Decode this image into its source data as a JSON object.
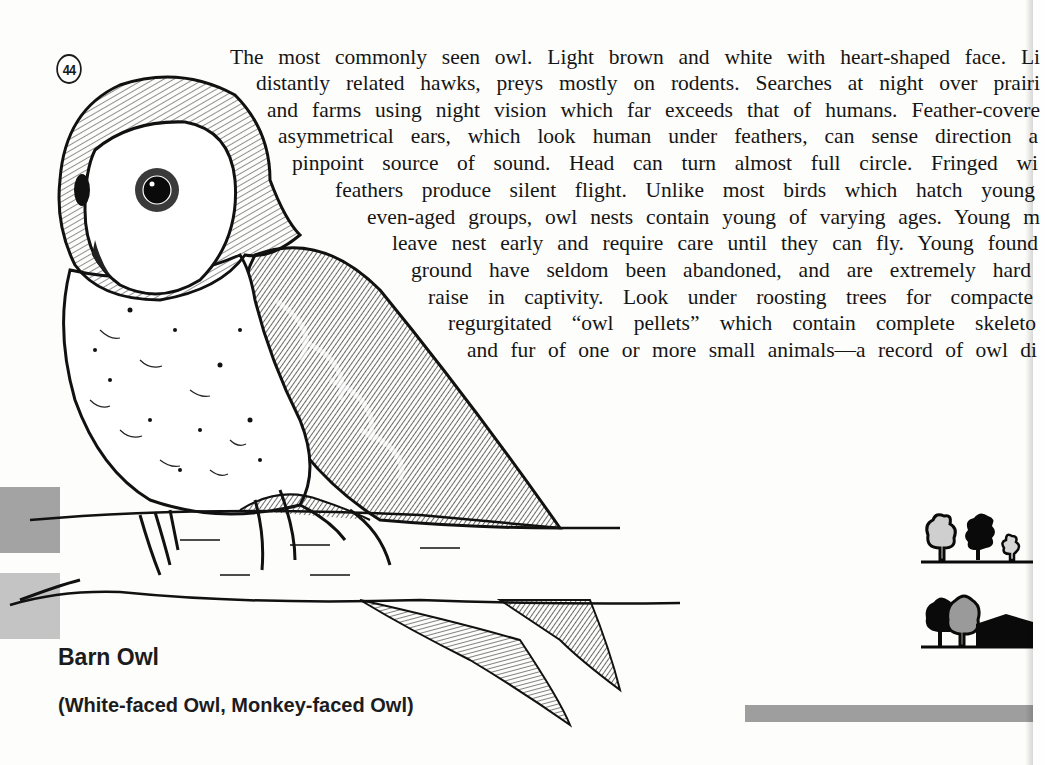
{
  "plate": {
    "number": "44"
  },
  "species": {
    "common_name": "Barn Owl",
    "alternate_names": "(White-faced Owl, Monkey-faced Owl)"
  },
  "description": {
    "lines": [
      "The most commonly seen owl. Light brown and white with heart-shaped face. Li",
      "distantly related hawks, preys mostly on rodents. Searches at night over prairi",
      "and farms using night vision which far exceeds that of humans. Feather-covere",
      "asymmetrical ears, which look human under feathers, can sense direction a",
      "pinpoint source of sound. Head can turn almost full circle. Fringed wi",
      "feathers produce silent flight. Unlike most birds which hatch young",
      "even-aged groups, owl nests contain young of varying ages. Young m",
      "leave nest early and require care until they can fly. Young found",
      "ground have seldom been abandoned, and are extremely hard",
      "raise in captivity. Look under roosting trees for compacte",
      "regurgitated “owl pellets” which contain complete skeleto",
      "and fur of one or more small animals—a record of owl di"
    ]
  },
  "habitat_icons": [
    {
      "name": "trees-open-woodland-icon",
      "description": "three trees on ground line"
    },
    {
      "name": "trees-farm-building-icon",
      "description": "two trees beside a barn"
    }
  ],
  "colors": {
    "ink": "#151515",
    "tab_dark": "#a3a3a3",
    "tab_light": "#c4c4c4",
    "range_bar": "#9e9e9e",
    "paper": "#fdfdfc"
  }
}
